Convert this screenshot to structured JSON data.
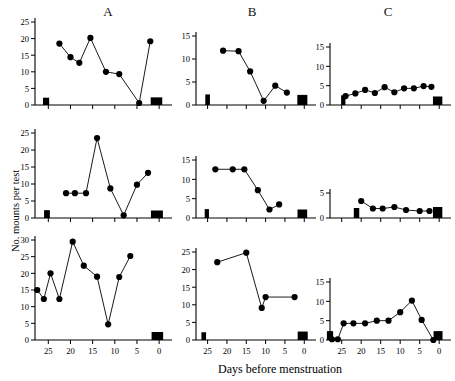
{
  "figure": {
    "xlabel": "Days before menstruation",
    "ylabel": "No. mounts per test",
    "column_titles": [
      "A",
      "B",
      "C"
    ]
  },
  "chart_data": [
    {
      "type": "line",
      "panel": "A-top",
      "title": "A",
      "xlabel": "",
      "ylabel": "No. mounts per test",
      "xlim": [
        28,
        -2
      ],
      "ylim": [
        0,
        25
      ],
      "yticks": [
        0,
        5,
        10,
        15,
        20,
        25
      ],
      "xticks": [
        25,
        20,
        15,
        10,
        5,
        0
      ],
      "grid": false,
      "x": [
        22.5,
        20.0,
        18.0,
        15.5,
        12.0,
        9.0,
        4.5,
        2.0
      ],
      "values": [
        18.5,
        14.4,
        12.7,
        20.2,
        10.0,
        9.3,
        0.6,
        19.2
      ],
      "menses_bars": [
        {
          "x": 25.5,
          "width": 1.4,
          "height": 2.2
        },
        {
          "x": 0.6,
          "width": 2.6,
          "height": 2.3
        }
      ]
    },
    {
      "type": "line",
      "panel": "B-top",
      "title": "B",
      "xlabel": "",
      "ylabel": "",
      "xlim": [
        28,
        -2
      ],
      "ylim": [
        0,
        15
      ],
      "yticks": [
        0,
        5,
        10,
        15
      ],
      "xticks": [
        25,
        20,
        15,
        10,
        5,
        0
      ],
      "grid": false,
      "x": [
        21.0,
        17.0,
        14.0,
        10.5,
        7.5,
        4.5
      ],
      "values": [
        11.8,
        11.7,
        7.3,
        0.9,
        4.2,
        2.7
      ],
      "menses_bars": [
        {
          "x": 25.0,
          "width": 1.2,
          "height": 2.3
        },
        {
          "x": 0.5,
          "width": 2.6,
          "height": 2.2
        }
      ]
    },
    {
      "type": "line",
      "panel": "C-top",
      "title": "C",
      "xlabel": "",
      "ylabel": "",
      "xlim": [
        28,
        -2
      ],
      "ylim": [
        0,
        15
      ],
      "yticks": [
        0,
        5,
        10,
        15
      ],
      "xticks": [
        25,
        20,
        15,
        10,
        5,
        0
      ],
      "grid": false,
      "x": [
        24.0,
        21.5,
        19.0,
        16.5,
        14.0,
        11.5,
        9.0,
        6.5,
        4.0,
        2.0
      ],
      "values": [
        2.3,
        3.0,
        3.9,
        3.1,
        4.6,
        3.3,
        4.3,
        4.3,
        4.9,
        4.7
      ],
      "menses_bars": [
        {
          "x": 24.6,
          "width": 1.1,
          "height": 2.5
        },
        {
          "x": 0.4,
          "width": 2.4,
          "height": 2.2
        }
      ]
    },
    {
      "type": "line",
      "panel": "A-middle",
      "title": "",
      "xlabel": "",
      "ylabel": "No. mounts per test",
      "xlim": [
        28,
        -2
      ],
      "ylim": [
        0,
        25
      ],
      "yticks": [
        0,
        5,
        10,
        15,
        20,
        25
      ],
      "xticks": [
        25,
        20,
        15,
        10,
        5,
        0
      ],
      "grid": false,
      "x": [
        21.0,
        19.0,
        16.5,
        14.0,
        11.0,
        8.0,
        5.0,
        2.5
      ],
      "values": [
        7.3,
        7.3,
        7.3,
        23.5,
        8.7,
        0.8,
        9.8,
        13.3
      ],
      "menses_bars": [
        {
          "x": 25.3,
          "width": 1.3,
          "height": 2.3
        },
        {
          "x": 0.5,
          "width": 2.7,
          "height": 2.2
        }
      ]
    },
    {
      "type": "line",
      "panel": "B-middle",
      "title": "",
      "xlabel": "",
      "ylabel": "",
      "xlim": [
        28,
        -2
      ],
      "ylim": [
        0,
        15
      ],
      "yticks": [
        0,
        5,
        10,
        15
      ],
      "xticks": [
        25,
        20,
        15,
        10,
        5,
        0
      ],
      "grid": false,
      "x": [
        23.0,
        18.5,
        15.5,
        12.0,
        9.0,
        6.5
      ],
      "values": [
        12.6,
        12.6,
        12.6,
        7.2,
        2.2,
        3.5
      ],
      "menses_bars": [
        {
          "x": 25.2,
          "width": 1.1,
          "height": 2.3
        },
        {
          "x": 0.5,
          "width": 2.5,
          "height": 2.2
        }
      ]
    },
    {
      "type": "line",
      "panel": "C-middle",
      "title": "",
      "xlabel": "",
      "ylabel": "",
      "xlim": [
        28,
        -2
      ],
      "ylim": [
        0,
        5
      ],
      "yticks": [
        0,
        5
      ],
      "xticks": [
        25,
        20,
        15,
        10,
        5,
        0
      ],
      "grid": false,
      "x": [
        20.0,
        17.0,
        14.5,
        11.5,
        8.5,
        5.0,
        2.5
      ],
      "values": [
        3.4,
        1.9,
        1.9,
        2.2,
        1.6,
        1.4,
        1.4
      ],
      "menses_bars": [
        {
          "x": 21.2,
          "width": 1.4,
          "height": 2.0
        },
        {
          "x": 0.4,
          "width": 2.4,
          "height": 2.2
        }
      ]
    },
    {
      "type": "line",
      "panel": "A-bottom",
      "title": "",
      "xlabel": "Days before menstruation",
      "ylabel": "No. mounts per test",
      "xlim": [
        28,
        -2
      ],
      "ylim": [
        0,
        30
      ],
      "yticks": [
        0,
        5,
        10,
        15,
        20,
        25,
        30
      ],
      "xticks": [
        25,
        20,
        15,
        10,
        5,
        0
      ],
      "grid": false,
      "x": [
        27.5,
        26.0,
        24.5,
        22.5,
        19.5,
        17.0,
        14.0,
        11.5,
        9.0,
        6.5
      ],
      "values": [
        15.0,
        12.3,
        20.0,
        12.3,
        29.5,
        22.3,
        19.0,
        4.7,
        18.9,
        25.2
      ],
      "menses_bars": [
        {
          "x": 0.4,
          "width": 2.6,
          "height": 2.4
        }
      ]
    },
    {
      "type": "line",
      "panel": "B-bottom",
      "title": "",
      "xlabel": "",
      "ylabel": "",
      "xlim": [
        28,
        -2
      ],
      "ylim": [
        0,
        25
      ],
      "yticks": [
        0,
        5,
        10,
        15,
        20,
        25
      ],
      "xticks": [
        25,
        20,
        15,
        10,
        5,
        0
      ],
      "grid": false,
      "x": [
        22.5,
        15.0,
        11.0,
        10.0,
        2.5
      ],
      "values": [
        22.1,
        24.8,
        9.1,
        12.2,
        12.2
      ],
      "menses_bars": [
        {
          "x": 26.0,
          "width": 1.2,
          "height": 2.2
        },
        {
          "x": 0.4,
          "width": 2.6,
          "height": 2.4
        }
      ]
    },
    {
      "type": "line",
      "panel": "C-bottom",
      "title": "",
      "xlabel": "",
      "ylabel": "",
      "xlim": [
        28,
        -2
      ],
      "ylim": [
        0,
        15
      ],
      "yticks": [
        0,
        5,
        10,
        15
      ],
      "xticks": [
        25,
        20,
        15,
        10,
        5,
        0
      ],
      "grid": false,
      "x": [
        27.5,
        26.0,
        24.5,
        22.0,
        19.0,
        16.0,
        13.0,
        10.0,
        7.0,
        4.5,
        1.5
      ],
      "values": [
        0.2,
        0.2,
        4.3,
        4.3,
        4.3,
        5.0,
        5.0,
        7.2,
        10.2,
        5.2,
        0.0
      ],
      "menses_bars": [
        {
          "x": 28.0,
          "width": 1.6,
          "height": 2.3
        },
        {
          "x": 0.3,
          "width": 2.3,
          "height": 2.3
        }
      ]
    }
  ]
}
